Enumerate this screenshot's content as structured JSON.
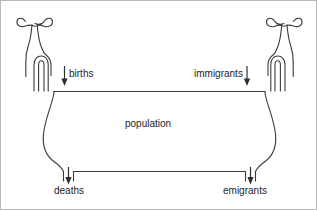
{
  "diagram": {
    "title": "population",
    "type": "stock-and-flow bathtub model",
    "stock": {
      "name": "population-vessel",
      "label": "population"
    },
    "inflows": [
      {
        "id": "births",
        "label": "births",
        "icon": "tap-icon",
        "arrow": "down-arrow-icon",
        "side": "left"
      },
      {
        "id": "immigrants",
        "label": "immigrants",
        "icon": "tap-icon",
        "arrow": "down-arrow-icon",
        "side": "right"
      }
    ],
    "outflows": [
      {
        "id": "deaths",
        "label": "deaths",
        "icon": "drain-icon",
        "arrow": "down-arrow-icon",
        "side": "left"
      },
      {
        "id": "emigrants",
        "label": "emigrants",
        "icon": "drain-icon",
        "arrow": "down-arrow-icon",
        "side": "right"
      }
    ],
    "colors": {
      "stroke": "#3b3b3b",
      "arrow": "#2e2e2e",
      "text": "#232323",
      "background": "#ffffff",
      "border": "#b9b9b9"
    }
  }
}
